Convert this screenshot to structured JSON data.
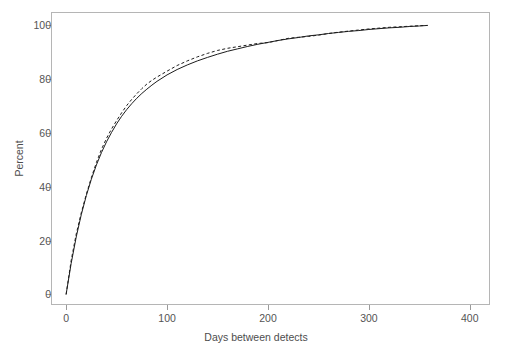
{
  "chart_data": {
    "type": "line",
    "title": "",
    "subtitle": "",
    "xlabel": "Days between detects",
    "ylabel": "Percent",
    "xlim": [
      -15,
      420
    ],
    "ylim": [
      -4,
      105
    ],
    "xticks": [
      0,
      100,
      200,
      300,
      400
    ],
    "xtick_labels": [
      "0",
      "100",
      "200",
      "300",
      "400"
    ],
    "yticks": [
      0,
      20,
      40,
      60,
      80,
      100
    ],
    "ytick_labels": [
      "0",
      "20",
      "40",
      "60",
      "80",
      "100"
    ],
    "grid": false,
    "legend": "none",
    "frame": true,
    "series": [
      {
        "name": "Fitted cumulative distribution",
        "style": "solid",
        "color": "#1c1c1c",
        "x": [
          0,
          5,
          10,
          15,
          20,
          25,
          30,
          35,
          40,
          45,
          50,
          55,
          60,
          65,
          70,
          75,
          80,
          85,
          90,
          95,
          100,
          110,
          120,
          130,
          140,
          150,
          160,
          170,
          180,
          190,
          200,
          210,
          220,
          230,
          240,
          250,
          260,
          270,
          280,
          290,
          300,
          310,
          320,
          330,
          340,
          350,
          358
        ],
        "y": [
          0,
          11.5,
          21.3,
          29.6,
          36.7,
          42.8,
          48.1,
          52.7,
          56.7,
          60.2,
          63.4,
          66.2,
          68.7,
          70.9,
          72.9,
          74.7,
          76.3,
          77.8,
          79.2,
          80.4,
          81.6,
          83.6,
          85.3,
          86.8,
          88.1,
          89.3,
          90.4,
          91.3,
          92.2,
          93.0,
          93.7,
          94.4,
          95.0,
          95.5,
          96.1,
          96.5,
          97.0,
          97.4,
          97.8,
          98.1,
          98.5,
          98.8,
          99.1,
          99.3,
          99.6,
          99.8,
          100
        ]
      },
      {
        "name": "Empirical cumulative distribution",
        "style": "dashed",
        "color": "#1c1c1c",
        "x": [
          0,
          5,
          10,
          15,
          20,
          25,
          30,
          35,
          40,
          45,
          50,
          55,
          60,
          65,
          70,
          75,
          80,
          85,
          90,
          95,
          100,
          110,
          120,
          130,
          140,
          150,
          160,
          170,
          180,
          190,
          200,
          210,
          220,
          230,
          240,
          250,
          260,
          270,
          280,
          290,
          300,
          310,
          320,
          330,
          340,
          350,
          358
        ],
        "y": [
          0,
          12.6,
          22.4,
          30.3,
          37.2,
          43.4,
          49.0,
          53.9,
          58.0,
          61.5,
          64.6,
          67.5,
          70.2,
          72.5,
          74.6,
          76.5,
          78.2,
          79.6,
          80.8,
          81.9,
          83.0,
          85.1,
          86.8,
          88.3,
          89.6,
          90.7,
          91.5,
          92.1,
          92.7,
          93.3,
          93.6,
          94.4,
          95.2,
          95.6,
          95.9,
          96.4,
          97.0,
          97.5,
          97.9,
          98.3,
          98.7,
          99.0,
          99.3,
          99.5,
          99.7,
          99.9,
          100
        ]
      }
    ]
  }
}
